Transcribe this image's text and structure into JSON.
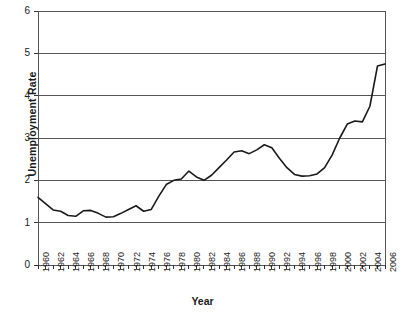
{
  "chart_data": {
    "type": "line",
    "title": "",
    "xlabel": "Year",
    "ylabel": "Unemployment Rate",
    "xlim": [
      1960,
      2006
    ],
    "ylim": [
      0,
      6
    ],
    "ytick_labels": [
      "0",
      "1",
      "2",
      "3",
      "4",
      "5",
      "6"
    ],
    "ytick_values": [
      0,
      1,
      2,
      3,
      4,
      5,
      6
    ],
    "xtick_labels": [
      "1960",
      "1962",
      "1964",
      "1966",
      "1968",
      "1970",
      "1972",
      "1974",
      "1976",
      "1978",
      "1980",
      "1982",
      "1984",
      "1986",
      "1988",
      "1990",
      "1992",
      "1994",
      "1996",
      "1998",
      "2000",
      "2002",
      "2004",
      "2006"
    ],
    "xtick_values": [
      1960,
      1962,
      1964,
      1966,
      1968,
      1970,
      1972,
      1974,
      1976,
      1978,
      1980,
      1982,
      1984,
      1986,
      1988,
      1990,
      1992,
      1994,
      1996,
      1998,
      2000,
      2002,
      2004,
      2006
    ],
    "grid": "horizontal",
    "legend": "none",
    "line_color": "#1a1a1a",
    "x": [
      1960,
      1961,
      1962,
      1963,
      1964,
      1965,
      1966,
      1967,
      1968,
      1969,
      1970,
      1971,
      1972,
      1973,
      1974,
      1975,
      1976,
      1977,
      1978,
      1979,
      1980,
      1981,
      1982,
      1983,
      1984,
      1985,
      1986,
      1987,
      1988,
      1989,
      1990,
      1991,
      1992,
      1993,
      1994,
      1995,
      1996,
      1997,
      1998,
      1999,
      2000,
      2001,
      2002,
      2003,
      2004,
      2005,
      2006
    ],
    "values": [
      1.6,
      1.45,
      1.3,
      1.27,
      1.17,
      1.15,
      1.28,
      1.29,
      1.22,
      1.13,
      1.14,
      1.22,
      1.31,
      1.4,
      1.27,
      1.31,
      1.62,
      1.9,
      2.0,
      2.03,
      2.22,
      2.08,
      2.0,
      2.12,
      2.3,
      2.48,
      2.67,
      2.7,
      2.63,
      2.72,
      2.84,
      2.77,
      2.52,
      2.3,
      2.14,
      2.1,
      2.11,
      2.15,
      2.3,
      2.6,
      3.0,
      3.33,
      3.4,
      3.38,
      3.75,
      4.7,
      4.75
    ],
    "series_name": "Unemployment Rate"
  },
  "series_override": {
    "note": "annual values 1960-2006",
    "values": [
      1.6,
      1.45,
      1.3,
      1.27,
      1.17,
      1.15,
      1.28,
      1.29,
      1.22,
      1.13,
      1.14,
      1.22,
      1.31,
      1.4,
      1.27,
      1.31,
      1.62,
      1.9,
      2.0,
      2.22,
      2.06,
      2.0,
      2.12,
      2.3,
      2.45,
      2.67,
      2.7,
      2.63,
      2.72,
      2.84,
      2.77,
      2.52,
      2.28,
      2.12,
      2.1,
      2.11,
      2.18,
      2.4,
      2.78,
      3.0,
      3.33,
      3.38,
      3.36,
      3.8,
      4.7,
      4.75,
      5.1
    ]
  }
}
